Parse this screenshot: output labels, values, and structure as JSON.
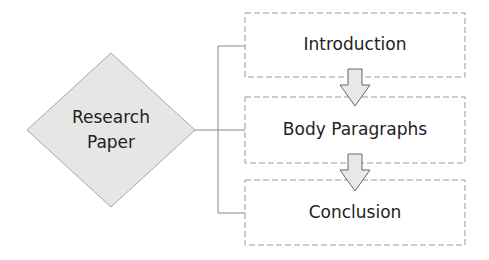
{
  "diagram": {
    "root": {
      "label_line1": "Research",
      "label_line2": "Paper"
    },
    "steps": [
      {
        "label": "Introduction"
      },
      {
        "label": "Body Paragraphs"
      },
      {
        "label": "Conclusion"
      }
    ],
    "colors": {
      "diamond_fill": "#e6e6e6",
      "stroke": "#999999",
      "arrow_fill": "#e8e8e8",
      "text": "#222222"
    }
  }
}
